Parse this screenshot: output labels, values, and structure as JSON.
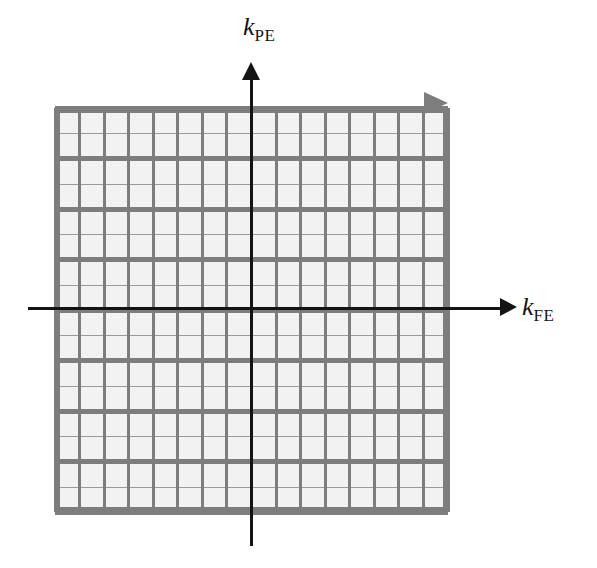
{
  "figure": {
    "name": "k-space-cartesian-sampling-diagram",
    "background_color": "#ffffff"
  },
  "axes": {
    "vertical": {
      "variable": "k",
      "subscript": "PE",
      "label": "k_PE",
      "meaning": "phase encoding direction",
      "arrow_direction": "up",
      "color": "#141414"
    },
    "horizontal": {
      "variable": "k",
      "subscript": "FE",
      "label": "k_FE",
      "meaning": "frequency encoding direction",
      "arrow_direction": "right",
      "color": "#141414"
    }
  },
  "grid": {
    "name": "k-space-sampling-grid",
    "columns": 16,
    "rows": 16,
    "major_row_bands": 8,
    "subrows_per_band": 2,
    "cell_fill_color": "#f2f2f2",
    "major_line_color": "#7d7d7d",
    "minor_line_color": "#9a9a9a",
    "border_color": "#7d7d7d",
    "trajectory_arrow_color": "#7d7d7d",
    "trajectory_arrow_direction": "right"
  }
}
